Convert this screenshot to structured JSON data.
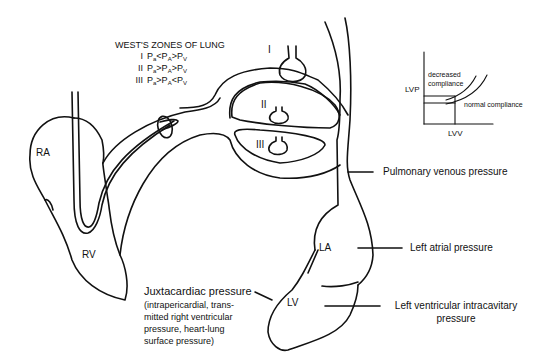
{
  "west_zones": {
    "heading": "WEST'S ZONES OF LUNG",
    "zones": [
      {
        "numeral": "I",
        "formula": "Pa<PA>Pv",
        "parts": [
          "P",
          "a",
          "<P",
          "A",
          ">P",
          "V"
        ]
      },
      {
        "numeral": "II",
        "formula": "Pa>PA>Pv",
        "parts": [
          "P",
          "a",
          ">P",
          "A",
          ">P",
          "V"
        ]
      },
      {
        "numeral": "III",
        "formula": "Pa>PA<Pv",
        "parts": [
          "P",
          "a",
          ">P",
          "A",
          "<P",
          "V"
        ]
      }
    ]
  },
  "chambers": {
    "ra": "RA",
    "rv": "RV",
    "la": "LA",
    "lv": "LV"
  },
  "alveoli_labels": {
    "zone1": "I",
    "zone2": "II",
    "zone3": "III"
  },
  "pressure_labels": {
    "pulmonary_venous": "Pulmonary venous pressure",
    "left_atrial": "Left atrial pressure",
    "lv_intracavitary_line1": "Left ventricular intracavitary",
    "lv_intracavitary_line2": "pressure",
    "juxtacardiac_main": "Juxtacardiac pressure",
    "juxtacardiac_detail": [
      "(intrapericardial, trans-",
      "mitted right ventricular",
      "pressure, heart-lung",
      "surface pressure)"
    ]
  },
  "compliance_inset": {
    "y_axis": "LVP",
    "x_axis": "LVV",
    "curve_decreased": "decreased compliance",
    "curve_decreased_line1": "decreased",
    "curve_decreased_line2": "compliance",
    "curve_normal": "normal compliance"
  }
}
